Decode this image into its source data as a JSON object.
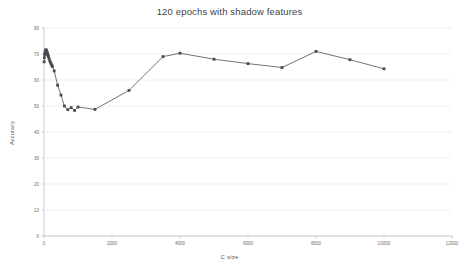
{
  "chart_data": {
    "type": "line",
    "title": "120 epochs with shadow features",
    "xlabel": "C size",
    "ylabel": "Accuracy",
    "xlim": [
      0,
      12000
    ],
    "ylim": [
      0,
      80
    ],
    "grid": true,
    "legend": false,
    "xticks": [
      0,
      2000,
      4000,
      6000,
      8000,
      10000,
      12000
    ],
    "xtick_labels": [
      "0",
      "2000",
      "4000",
      "6000",
      "8000",
      "10000",
      "12000"
    ],
    "yticks": [
      0,
      10,
      20,
      30,
      40,
      50,
      60,
      70,
      80
    ],
    "ytick_labels": [
      "0",
      "10",
      "20",
      "30",
      "40",
      "50",
      "60",
      "70",
      "80"
    ],
    "series": [
      {
        "name": "Accuracy",
        "color": "#6b6b6f",
        "marker": "square",
        "x": [
          5,
          10,
          20,
          30,
          40,
          50,
          60,
          70,
          80,
          90,
          100,
          110,
          120,
          130,
          150,
          170,
          190,
          210,
          230,
          250,
          300,
          400,
          500,
          600,
          700,
          800,
          900,
          1000,
          1500,
          2500,
          3500,
          4000,
          5000,
          6000,
          7000,
          8000,
          9000,
          10000
        ],
        "y": [
          67.0,
          68.6,
          69.8,
          70.6,
          71.2,
          71.5,
          71.6,
          71.4,
          71.0,
          70.6,
          70.2,
          69.8,
          69.4,
          69.0,
          68.2,
          67.4,
          66.8,
          66.2,
          65.6,
          65.2,
          63.5,
          58.0,
          54.2,
          50.0,
          48.6,
          49.4,
          48.3,
          49.6,
          48.7,
          56.0,
          69.0,
          70.3,
          68.0,
          66.3,
          64.8,
          71.0,
          67.8,
          64.3
        ]
      }
    ]
  }
}
